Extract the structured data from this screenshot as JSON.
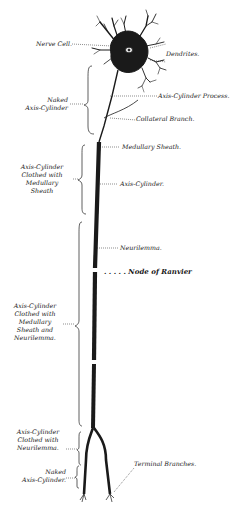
{
  "diagram": {
    "colors": {
      "ink": "#1a1a1a",
      "background": "#ffffff"
    },
    "labels": {
      "nerve_cell": "Nerve Cell.",
      "dendrites": "Dendrites.",
      "axis_cylinder_process": "Axis-Cylinder Process.",
      "naked_axis_cylinder_top_1": "Naked",
      "naked_axis_cylinder_top_2": "Axis-Cylinder",
      "collateral_branch": "Collateral Branch.",
      "medullary_sheath": "Medullary Sheath.",
      "clothed_medullary_1": "Axis-Cylinder",
      "clothed_medullary_2": "Clothed with",
      "clothed_medullary_3": "Medullary",
      "clothed_medullary_4": "Sheath",
      "axis_cylinder": "Axis-Cylinder.",
      "neurilemma": "Neurilemma.",
      "node_of_ranvier": ". . . . . Node of Ranvier",
      "clothed_both_1": "Axis-Cylinder",
      "clothed_both_2": "Clothed with",
      "clothed_both_3": "Medullary",
      "clothed_both_4": "Sheath and",
      "clothed_both_5": "Neurilemma.",
      "clothed_neurilemma_1": "Axis-Cylinder",
      "clothed_neurilemma_2": "Clothed with",
      "clothed_neurilemma_3": "Neurilemma.",
      "naked_axis_cylinder_bottom_1": "Naked",
      "naked_axis_cylinder_bottom_2": "Axis-Cylinder.",
      "terminal_branches": "Terminal Branches."
    }
  }
}
